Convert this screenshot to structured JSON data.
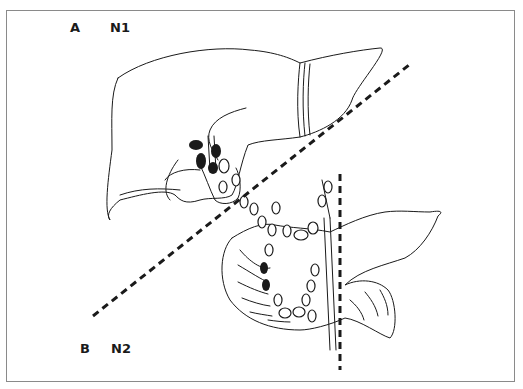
{
  "figure": {
    "panel_a": {
      "letter": "A",
      "stage": "N1",
      "organ": "liver"
    },
    "panel_b": {
      "letter": "B",
      "stage": "N2",
      "organ": "pancreas-duodenum"
    },
    "divider_diagonal": {
      "style": "dashed",
      "from": [
        93,
        316
      ],
      "to": [
        409,
        65
      ]
    },
    "divider_vertical": {
      "style": "dashed",
      "x": 340,
      "from_y": 174,
      "to_y": 370
    },
    "colors": {
      "ink": "#1a1a1a",
      "frame": "#8a8a8a",
      "background": "#ffffff"
    }
  }
}
